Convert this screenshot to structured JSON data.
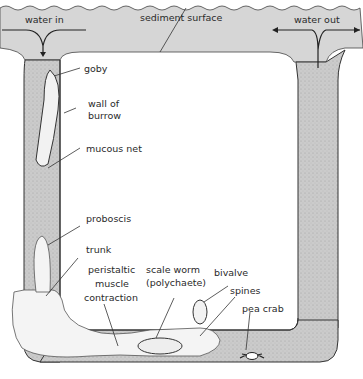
{
  "diagram": {
    "labels": {
      "water_in": "water in",
      "sediment_surface": "sediment surface",
      "water_out": "water out",
      "goby": "goby",
      "wall_of_burrow_1": "wall of",
      "wall_of_burrow_2": "burrow",
      "mucous_net": "mucous net",
      "proboscis": "proboscis",
      "trunk": "trunk",
      "peristaltic_1": "peristaltic",
      "peristaltic_2": "muscle",
      "peristaltic_3": "contraction",
      "scale_worm_1": "scale worm",
      "scale_worm_2": "(polychaete)",
      "bivalve": "bivalve",
      "spines": "spines",
      "pea_crab": "pea crab"
    },
    "colors": {
      "sediment": "#d6d6d6",
      "burrow_fill": "#c8c8c8",
      "outline": "#333333",
      "worm": "#f2f2f2"
    }
  }
}
